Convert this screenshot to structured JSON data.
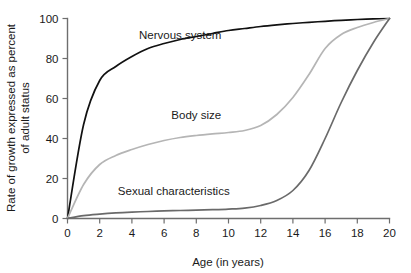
{
  "chart_data": {
    "type": "line",
    "title": "",
    "xlabel": "Age (in years)",
    "ylabel": "Rate of growth expressed as percent of adult status",
    "ylabel_line1": "Rate of growth expressed as percent",
    "ylabel_line2": "of adult status",
    "xlim": [
      0,
      20
    ],
    "ylim": [
      0,
      100
    ],
    "xticks": [
      0,
      2,
      4,
      6,
      8,
      10,
      12,
      14,
      16,
      18,
      20
    ],
    "yticks": [
      0,
      20,
      40,
      60,
      80,
      100
    ],
    "xtick_labels": [
      "0",
      "2",
      "4",
      "6",
      "8",
      "10",
      "12",
      "14",
      "16",
      "18",
      "20"
    ],
    "ytick_labels": [
      "0",
      "20",
      "40",
      "60",
      "80",
      "100"
    ],
    "grid": false,
    "legend": "inline-labels",
    "x": [
      0,
      1,
      2,
      3,
      4,
      5,
      6,
      7,
      8,
      9,
      10,
      11,
      12,
      13,
      14,
      15,
      16,
      17,
      18,
      19,
      20
    ],
    "series": [
      {
        "name": "Nervous system",
        "color": "#111111",
        "label_x": 7.0,
        "label_y": 90,
        "values": [
          0,
          47,
          69,
          76,
          81,
          85,
          87.5,
          89.5,
          91,
          92.5,
          94,
          95,
          96,
          96.8,
          97.5,
          98.1,
          98.6,
          99.1,
          99.5,
          99.8,
          100
        ]
      },
      {
        "name": "Body size",
        "color": "#b5b5b5",
        "label_x": 8.0,
        "label_y": 50,
        "values": [
          0,
          17,
          27,
          31.5,
          34.5,
          37,
          39,
          40.5,
          41.5,
          42.3,
          43,
          44,
          46.5,
          52,
          60.5,
          72,
          85,
          92,
          95.5,
          98,
          100
        ]
      },
      {
        "name": "Sexual characteristics",
        "color": "#6a6a6a",
        "label_x": 6.6,
        "label_y": 12,
        "values": [
          0,
          1.4,
          2.2,
          2.8,
          3.2,
          3.5,
          3.8,
          4.0,
          4.2,
          4.4,
          4.7,
          5.2,
          6.5,
          9.0,
          14.0,
          24.0,
          40.0,
          58.0,
          74.0,
          88.0,
          100
        ]
      }
    ]
  }
}
